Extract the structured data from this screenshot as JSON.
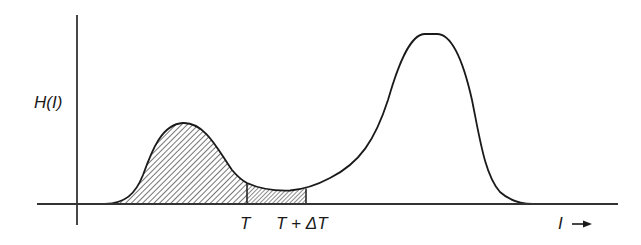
{
  "diagram": {
    "type": "histogram-threshold",
    "y_axis_label": "H(I)",
    "x_axis_label": "I",
    "x_axis_arrow": "arrow-right",
    "threshold_label": "T",
    "threshold_delta_label": "T + ΔT",
    "colors": {
      "line": "#1a1a1a",
      "hatch": "#2a2a2a",
      "background": "#ffffff"
    },
    "curves": [
      {
        "name": "left-peak",
        "shaded": true,
        "peak_x": 180,
        "peak_y": 123
      },
      {
        "name": "right-peak",
        "shaded": false,
        "peak_x": 431,
        "peak_y": 34
      }
    ],
    "regions": [
      {
        "name": "below-threshold",
        "from": "start",
        "to": "T",
        "hatch": "sparse-diagonal"
      },
      {
        "name": "threshold-band",
        "from": "T",
        "to": "T + ΔT",
        "hatch": "dense-diagonal"
      }
    ]
  }
}
